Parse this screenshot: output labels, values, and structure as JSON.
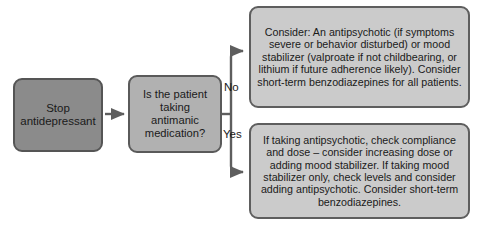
{
  "figure": {
    "type": "flowchart",
    "orientation": "left-to-right",
    "background_color": "#ffffff",
    "line_color": "#5e5e5e"
  },
  "nodes": {
    "stop": {
      "text": "Stop\nantidepressant",
      "fill_color": "#8b8b8b",
      "border_color": "#555555",
      "shape": "rounded-rectangle"
    },
    "decision": {
      "text": "Is the patient\ntaking\nantimanic\nmedication?",
      "fill_color": "#b1b1b1",
      "border_color": "#5a5a5a",
      "shape": "rounded-rectangle"
    },
    "no_branch": {
      "text": "Consider: An antipsychotic (if symptoms severe or behavior disturbed) or mood stabilizer (valproate if not childbearing, or lithium if future adherence likely). Consider short-term benzodiazepines for all patients.",
      "fill_color": "#cbcbcb",
      "border_color": "#5e5e5e",
      "shape": "rounded-rectangle"
    },
    "yes_branch": {
      "text": "If taking antipsychotic, check compliance and dose – consider increasing dose or adding mood stabilizer. If taking mood stabilizer only, check levels and consider adding antipsychotic. Consider short-term benzodiazepines.",
      "fill_color": "#cbcbcb",
      "border_color": "#5e5e5e",
      "shape": "rounded-rectangle"
    }
  },
  "edges": {
    "stop_to_decision": {
      "label": "",
      "from": "stop",
      "to": "decision",
      "style": "straight-arrow"
    },
    "decision_to_no": {
      "label": "No",
      "from": "decision",
      "to": "no_branch",
      "style": "elbow-arrow"
    },
    "decision_to_yes": {
      "label": "Yes",
      "from": "decision",
      "to": "yes_branch",
      "style": "elbow-arrow"
    }
  }
}
